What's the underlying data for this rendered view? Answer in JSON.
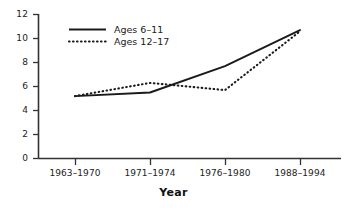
{
  "chart_data": {
    "type": "line",
    "title": "",
    "subtitle": "",
    "xlabel": "Year",
    "ylabel": "",
    "categories": [
      "1963–1970",
      "1971–1974",
      "1976–1980",
      "1988–1994"
    ],
    "ylim": [
      0,
      12
    ],
    "yticks": [
      "0",
      "2",
      "4",
      "6",
      "8",
      "10",
      "12"
    ],
    "ytick_values": [
      0,
      2,
      4,
      6,
      8,
      10,
      12
    ],
    "grid": false,
    "legend_position": "top-left-inside",
    "series": [
      {
        "name": "Ages 6–11",
        "style": "solid",
        "color": "#1a1a1a",
        "values": [
          5.2,
          5.5,
          7.7,
          10.7
        ]
      },
      {
        "name": "Ages 12–17",
        "style": "dotted",
        "color": "#1a1a1a",
        "values": [
          5.2,
          6.3,
          5.7,
          10.6
        ]
      }
    ]
  },
  "legend": {
    "entries": [
      {
        "label": "Ages 6–11"
      },
      {
        "label": "Ages 12–17"
      }
    ]
  },
  "axes": {
    "y_tick_labels": [
      "12",
      "10",
      "8",
      "6",
      "4",
      "2",
      "0"
    ],
    "x_tick_labels": [
      "1963–1970",
      "1971–1974",
      "1976–1980",
      "1988–1994"
    ],
    "x_axis_title": "Year"
  },
  "colors": {
    "ink": "#1a1a1a",
    "axis": "#333333",
    "background": "#ffffff"
  }
}
